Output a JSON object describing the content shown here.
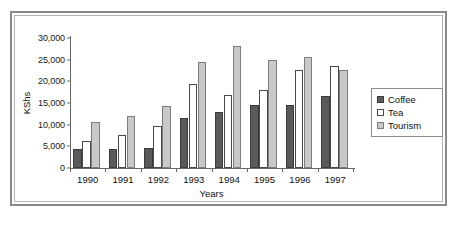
{
  "chart_data": {
    "type": "bar",
    "title": "",
    "xlabel": "Years",
    "ylabel": "KShs",
    "categories": [
      "1990",
      "1991",
      "1992",
      "1993",
      "1994",
      "1995",
      "1996",
      "1997"
    ],
    "series": [
      {
        "name": "Coffee",
        "color": "#5a5a5a",
        "values": [
          4500,
          4400,
          4700,
          11500,
          13000,
          14500,
          14500,
          16600
        ]
      },
      {
        "name": "Tea",
        "color": "#ffffff",
        "values": [
          6300,
          7600,
          9700,
          19400,
          16900,
          18000,
          22700,
          23600
        ]
      },
      {
        "name": "Tourism",
        "color": "#c9c9c9",
        "values": [
          10600,
          11900,
          14200,
          24400,
          28200,
          25000,
          25600,
          22700
        ]
      }
    ],
    "ylim": [
      0,
      30000
    ],
    "yticks": [
      0,
      5000,
      10000,
      15000,
      20000,
      25000,
      30000
    ],
    "ytick_labels": [
      "0",
      "5,000",
      "10,000",
      "15,000",
      "20,000",
      "25,000",
      "30,000"
    ],
    "grid": false,
    "legend_position": "right"
  },
  "legend": {
    "entries": [
      {
        "label": "Coffee"
      },
      {
        "label": "Tea"
      },
      {
        "label": "Tourism"
      }
    ]
  }
}
